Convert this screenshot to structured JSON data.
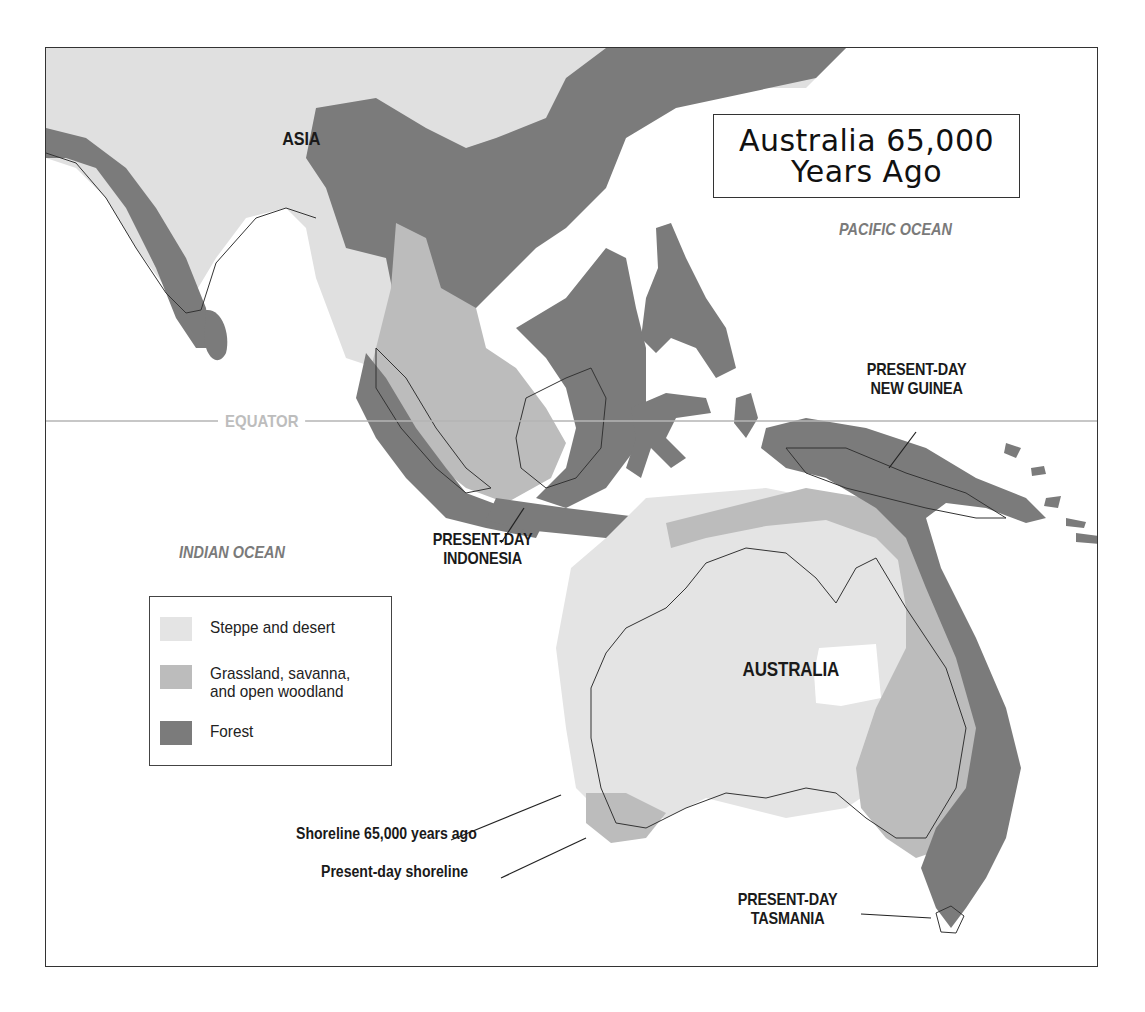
{
  "title": {
    "line1": "Australia 65,000",
    "line2": "Years Ago"
  },
  "labels": {
    "asia": "ASIA",
    "pacific_ocean": "PACIFIC OCEAN",
    "indian_ocean": "INDIAN OCEAN",
    "equator": "EQUATOR",
    "new_guinea_line1": "PRESENT-DAY",
    "new_guinea_line2": "NEW GUINEA",
    "indonesia_line1": "PRESENT-DAY",
    "indonesia_line2": "INDONESIA",
    "australia": "AUSTRALIA",
    "tasmania_line1": "PRESENT-DAY",
    "tasmania_line2": "TASMANIA",
    "shoreline_65000": "Shoreline 65,000 years ago",
    "present_shoreline": "Present-day shoreline"
  },
  "legend": {
    "items": [
      {
        "label": "Steppe and desert",
        "color": "#e4e4e4"
      },
      {
        "label_line1": "Grassland, savanna,",
        "label_line2": "and open woodland",
        "color": "#bcbcbc"
      },
      {
        "label": "Forest",
        "color": "#7b7b7b"
      }
    ]
  },
  "colors": {
    "steppe": "#e4e4e4",
    "grassland": "#bcbcbc",
    "forest": "#7b7b7b",
    "ocean": "#ffffff",
    "frame": "#333333",
    "equator_line": "#b5b5b5",
    "ocean_label": "#7a7a7a"
  }
}
